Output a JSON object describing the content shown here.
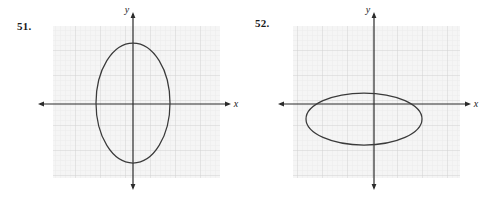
{
  "page": {
    "width": 493,
    "height": 201,
    "background": "#ffffff",
    "kind": "textbook-exercise-figures"
  },
  "style": {
    "panel_fill": "#f4f4f4",
    "grid_minor_color": "#e3e3e3",
    "grid_major_color": "#d2d2d2",
    "axis_color": "#2b2b2b",
    "curve_color": "#3a3a3a",
    "label_color": "#1a1a1a",
    "grid_minor_step": 5,
    "grid_major_step": 25
  },
  "problems": [
    {
      "id": "51",
      "number_label": "51.",
      "graph": {
        "name": "ellipse-graph-51",
        "panel": {
          "x": 53,
          "y": 26,
          "width": 167,
          "height": 152
        },
        "axes": {
          "x_label": "x",
          "y_label": "y",
          "origin": {
            "x": 133,
            "y": 104
          },
          "x_start": 38,
          "x_end": 231,
          "y_start": 12,
          "y_end": 190,
          "arrowheads": [
            "left",
            "right",
            "up",
            "down"
          ]
        },
        "curve": {
          "type": "ellipse",
          "orientation": "vertical",
          "center": {
            "x": 133,
            "y": 103
          },
          "radius_x": 37,
          "radius_y": 60
        }
      }
    },
    {
      "id": "52",
      "number_label": "52.",
      "graph": {
        "name": "ellipse-graph-52",
        "panel": {
          "x": 46,
          "y": 26,
          "width": 167,
          "height": 152
        },
        "origin_offset_note": "panel identical to 51, shifted left within its column",
        "axes": {
          "x_label": "x",
          "y_label": "y",
          "origin": {
            "x": 127,
            "y": 104
          },
          "x_start": 31,
          "x_end": 224,
          "y_start": 12,
          "y_end": 190,
          "arrowheads": [
            "left",
            "right",
            "up",
            "down"
          ]
        },
        "curve": {
          "type": "ellipse",
          "orientation": "horizontal",
          "center": {
            "x": 117,
            "y": 119
          },
          "radius_x": 58,
          "radius_y": 26
        }
      }
    }
  ]
}
